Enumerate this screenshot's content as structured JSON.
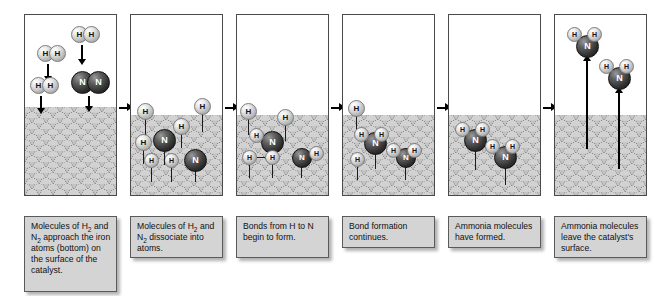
{
  "diagram": {
    "type": "process-sequence",
    "panel_count": 6,
    "colors": {
      "hydrogen_atom": "#e6e6e6",
      "nitrogen_atom": "#2d2d2d",
      "catalyst_surface": "#c3c3c3",
      "caption_background": "#d4d4d4",
      "panel_border": "#4a4a4a",
      "arrow": "#000000",
      "page_background": "#ffffff"
    }
  },
  "atom_labels": {
    "hydrogen": "H",
    "nitrogen": "N"
  },
  "steps": [
    {
      "index": 1,
      "caption_line1": "Molecules of H",
      "caption_sub1": "2",
      "caption_line2": " and N",
      "caption_sub2": "2",
      "caption_line3": " approach the iron atoms (bottom) on the surface of the catalyst.",
      "caption_plain": "Molecules of H2 and N2 approach the iron atoms (bottom) on the surface of the catalyst.",
      "species_shown": [
        "H2",
        "H2",
        "N2"
      ],
      "molecules_free": 3,
      "molecules_bound": 0,
      "motion": "downward"
    },
    {
      "index": 2,
      "caption_line1": "Molecules of H",
      "caption_sub1": "2",
      "caption_line2": " and N",
      "caption_sub2": "2",
      "caption_line3": " dissociate into atoms.",
      "caption_plain": "Molecules of H2 and N2 dissociate into atoms.",
      "species_shown": [
        "H",
        "H",
        "H",
        "H",
        "H",
        "N",
        "N"
      ],
      "molecules_free": 0,
      "molecules_bound": 7,
      "motion": "none"
    },
    {
      "index": 3,
      "caption_plain": "Bonds from H to N begin to form.",
      "species_shown": [
        "H",
        "H",
        "H",
        "H",
        "H",
        "N",
        "N"
      ],
      "molecules_free": 0,
      "molecules_bound": 7,
      "motion": "none"
    },
    {
      "index": 4,
      "caption_plain": "Bond formation continues.",
      "species_shown": [
        "H",
        "NH2",
        "NH2"
      ],
      "molecules_free": 0,
      "molecules_bound": 3,
      "motion": "none"
    },
    {
      "index": 5,
      "caption_plain": "Ammonia molecules have formed.",
      "species_shown": [
        "NH3",
        "NH3"
      ],
      "molecules_free": 0,
      "molecules_bound": 2,
      "motion": "none"
    },
    {
      "index": 6,
      "caption_plain": "Ammonia molecules leave the catalyst's surface.",
      "species_shown": [
        "NH3",
        "NH3"
      ],
      "molecules_free": 2,
      "molecules_bound": 0,
      "motion": "upward"
    }
  ],
  "captions": [
    "Molecules of H2 and N2 approach the iron atoms (bottom) on the surface of the catalyst.",
    "Molecules of H2 and N2 dissociate into atoms.",
    "Bonds from H to N begin to form.",
    "Bond formation continues.",
    "Ammonia molecules have formed.",
    "Ammonia molecules leave the catalyst's surface."
  ]
}
